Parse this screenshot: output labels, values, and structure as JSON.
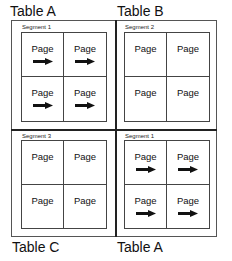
{
  "quadrants": [
    {
      "table_label": "Table A",
      "segment_label": "Segment 1",
      "has_arrows": true,
      "cells": [
        {
          "label": "Page",
          "icon": "arrow-right-icon"
        },
        {
          "label": "Page",
          "icon": "arrow-right-icon"
        },
        {
          "label": "Page",
          "icon": "arrow-right-icon"
        },
        {
          "label": "Page",
          "icon": "arrow-right-icon"
        }
      ]
    },
    {
      "table_label": "Table B",
      "segment_label": "Segment 2",
      "has_arrows": false,
      "cells": [
        {
          "label": "Page"
        },
        {
          "label": "Page"
        },
        {
          "label": "Page"
        },
        {
          "label": "Page"
        }
      ]
    },
    {
      "table_label": "Table C",
      "segment_label": "Segment 3",
      "has_arrows": false,
      "cells": [
        {
          "label": "Page"
        },
        {
          "label": "Page"
        },
        {
          "label": "Page"
        },
        {
          "label": "Page"
        }
      ]
    },
    {
      "table_label": "Table A",
      "segment_label": "Segment 1",
      "has_arrows": true,
      "cells": [
        {
          "label": "Page",
          "icon": "arrow-right-icon"
        },
        {
          "label": "Page",
          "icon": "arrow-right-icon"
        },
        {
          "label": "Page",
          "icon": "arrow-right-icon"
        },
        {
          "label": "Page",
          "icon": "arrow-right-icon"
        }
      ]
    }
  ],
  "colors": {
    "line": "#444444",
    "text": "#111111",
    "arrow": "#111111"
  }
}
